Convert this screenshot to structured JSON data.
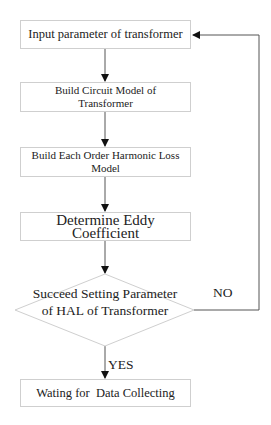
{
  "flowchart": {
    "steps": [
      {
        "id": "input",
        "label": "Input parameter of transformer"
      },
      {
        "id": "circuit",
        "label": "Build Circuit Model of Transformer"
      },
      {
        "id": "harmonic",
        "label": "Build Each Order Harmonic Loss Model"
      },
      {
        "id": "eddy",
        "label": "Determine Eddy Coefficient"
      },
      {
        "id": "decision",
        "label": "Succeed Setting Parameter of HAL of Transformer"
      },
      {
        "id": "wait",
        "label": "Wating for  Data Collecting"
      }
    ],
    "edges": [
      {
        "from": "input",
        "to": "circuit"
      },
      {
        "from": "circuit",
        "to": "harmonic"
      },
      {
        "from": "harmonic",
        "to": "eddy"
      },
      {
        "from": "eddy",
        "to": "decision"
      },
      {
        "from": "decision",
        "to": "wait",
        "label": "YES"
      },
      {
        "from": "decision",
        "to": "input",
        "label": "NO"
      }
    ],
    "yes_label": "YES",
    "no_label": "NO"
  }
}
